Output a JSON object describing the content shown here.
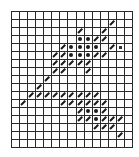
{
  "grid": {
    "cols": 15,
    "rows": 17,
    "cell_width": 8.07,
    "cell_height": 8,
    "line_color": "#2a2a2a",
    "mark_color": "#1a1a1a"
  },
  "legend_symbols": {
    "s": "diagonal-slash",
    "d": "filled-dot",
    "q": "small-square"
  },
  "marks": [
    {
      "r": 1,
      "c": 12,
      "t": "s"
    },
    {
      "r": 2,
      "c": 8,
      "t": "s"
    },
    {
      "r": 2,
      "c": 11,
      "t": "s"
    },
    {
      "r": 3,
      "c": 8,
      "t": "d"
    },
    {
      "r": 3,
      "c": 9,
      "t": "d"
    },
    {
      "r": 3,
      "c": 10,
      "t": "s"
    },
    {
      "r": 3,
      "c": 11,
      "t": "s"
    },
    {
      "r": 4,
      "c": 6,
      "t": "s"
    },
    {
      "r": 4,
      "c": 7,
      "t": "d"
    },
    {
      "r": 4,
      "c": 8,
      "t": "d"
    },
    {
      "r": 4,
      "c": 9,
      "t": "d"
    },
    {
      "r": 4,
      "c": 10,
      "t": "d"
    },
    {
      "r": 4,
      "c": 12,
      "t": "s"
    },
    {
      "r": 4,
      "c": 13,
      "t": "q"
    },
    {
      "r": 5,
      "c": 5,
      "t": "s"
    },
    {
      "r": 5,
      "c": 6,
      "t": "s"
    },
    {
      "r": 5,
      "c": 7,
      "t": "d"
    },
    {
      "r": 5,
      "c": 8,
      "t": "d"
    },
    {
      "r": 5,
      "c": 9,
      "t": "d"
    },
    {
      "r": 5,
      "c": 10,
      "t": "s"
    },
    {
      "r": 5,
      "c": 11,
      "t": "s"
    },
    {
      "r": 6,
      "c": 5,
      "t": "s"
    },
    {
      "r": 6,
      "c": 6,
      "t": "s"
    },
    {
      "r": 6,
      "c": 7,
      "t": "s"
    },
    {
      "r": 6,
      "c": 8,
      "t": "s"
    },
    {
      "r": 6,
      "c": 9,
      "t": "s"
    },
    {
      "r": 7,
      "c": 5,
      "t": "s"
    },
    {
      "r": 7,
      "c": 6,
      "t": "s"
    },
    {
      "r": 7,
      "c": 9,
      "t": "s"
    },
    {
      "r": 8,
      "c": 4,
      "t": "s"
    },
    {
      "r": 9,
      "c": 3,
      "t": "s"
    },
    {
      "r": 10,
      "c": 2,
      "t": "s"
    },
    {
      "r": 10,
      "c": 3,
      "t": "s"
    },
    {
      "r": 10,
      "c": 4,
      "t": "s"
    },
    {
      "r": 10,
      "c": 5,
      "t": "s"
    },
    {
      "r": 10,
      "c": 6,
      "t": "s"
    },
    {
      "r": 10,
      "c": 7,
      "t": "s"
    },
    {
      "r": 10,
      "c": 8,
      "t": "s"
    },
    {
      "r": 10,
      "c": 9,
      "t": "s"
    },
    {
      "r": 10,
      "c": 10,
      "t": "s"
    },
    {
      "r": 11,
      "c": 1,
      "t": "s"
    },
    {
      "r": 11,
      "c": 6,
      "t": "s"
    },
    {
      "r": 11,
      "c": 7,
      "t": "s"
    },
    {
      "r": 11,
      "c": 8,
      "t": "s"
    },
    {
      "r": 11,
      "c": 9,
      "t": "s"
    },
    {
      "r": 11,
      "c": 10,
      "t": "s"
    },
    {
      "r": 11,
      "c": 11,
      "t": "s"
    },
    {
      "r": 12,
      "c": 8,
      "t": "s"
    },
    {
      "r": 12,
      "c": 9,
      "t": "d"
    },
    {
      "r": 12,
      "c": 10,
      "t": "d"
    },
    {
      "r": 12,
      "c": 11,
      "t": "s"
    },
    {
      "r": 13,
      "c": 8,
      "t": "s"
    },
    {
      "r": 13,
      "c": 9,
      "t": "s"
    },
    {
      "r": 13,
      "c": 10,
      "t": "d"
    },
    {
      "r": 13,
      "c": 11,
      "t": "s"
    },
    {
      "r": 13,
      "c": 12,
      "t": "s"
    },
    {
      "r": 13,
      "c": 13,
      "t": "s"
    },
    {
      "r": 14,
      "c": 10,
      "t": "s"
    },
    {
      "r": 14,
      "c": 11,
      "t": "s"
    },
    {
      "r": 14,
      "c": 12,
      "t": "s"
    },
    {
      "r": 15,
      "c": 13,
      "t": "s"
    }
  ]
}
